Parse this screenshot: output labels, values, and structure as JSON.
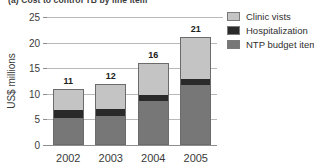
{
  "caption": "(a)  Cost to control TB by line item",
  "chart_data": {
    "type": "bar",
    "subtype": "stacked-bar",
    "title": "(a)  Cost to control TB by line item",
    "xlabel": "",
    "ylabel": "US$ millions",
    "categories": [
      "2002",
      "2003",
      "2004",
      "2005"
    ],
    "ylim": [
      0,
      25
    ],
    "yticks": [
      0,
      5,
      10,
      15,
      20,
      25
    ],
    "ytick_labels": [
      "0",
      "5",
      "10",
      "15",
      "20",
      "25"
    ],
    "grid": true,
    "grid_axis": "y",
    "legend_position": "right",
    "totals": [
      11,
      12,
      16,
      21
    ],
    "series": [
      {
        "name": "Clinic vists",
        "color": "#c4c4c4",
        "values": [
          4.2,
          5.0,
          6.1,
          8.0
        ],
        "stack_order": 3
      },
      {
        "name": "Hospitalization",
        "color": "#2a2a2a",
        "values": [
          1.6,
          1.4,
          1.2,
          1.2
        ],
        "stack_order": 2
      },
      {
        "name": "NTP budget items",
        "color": "#777777",
        "values": [
          5.2,
          5.6,
          8.7,
          11.8
        ],
        "stack_order": 1
      }
    ]
  },
  "legend": {
    "items": [
      {
        "label": "Clinic vists",
        "color": "#c4c4c4"
      },
      {
        "label": "Hospitalization",
        "color": "#2a2a2a"
      },
      {
        "label": "NTP budget items",
        "color": "#777777"
      }
    ]
  }
}
